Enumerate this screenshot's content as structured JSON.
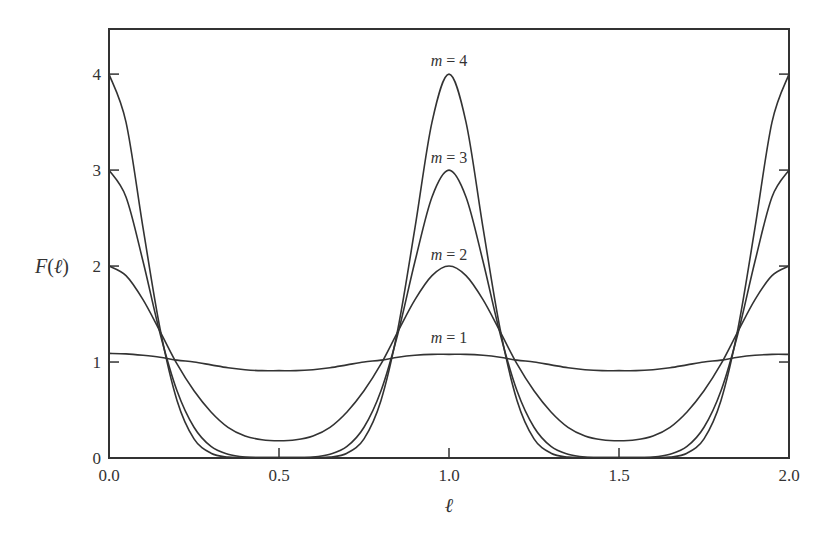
{
  "chart_data": {
    "type": "line",
    "title": "",
    "xlabel": "ℓ",
    "ylabel": "F(ℓ)",
    "xlim": [
      0.0,
      2.0
    ],
    "ylim": [
      0,
      4.5
    ],
    "grid": false,
    "legend": "inline curve labels",
    "x_ticks": [
      "0.0",
      "0.5",
      "1.0",
      "1.5",
      "2.0"
    ],
    "y_ticks": [
      "0",
      "1",
      "2",
      "3",
      "4"
    ],
    "annotations": [
      "m = 4",
      "m = 3",
      "m = 2",
      "m = 1"
    ],
    "x": [
      0.0,
      0.05,
      0.1,
      0.15,
      0.2,
      0.25,
      0.3,
      0.35,
      0.4,
      0.45,
      0.5,
      0.55,
      0.6,
      0.65,
      0.7,
      0.75,
      0.8,
      0.85,
      0.9,
      0.95,
      1.0,
      1.05,
      1.1,
      1.15,
      1.2,
      1.25,
      1.3,
      1.35,
      1.4,
      1.45,
      1.5,
      1.55,
      1.6,
      1.65,
      1.7,
      1.75,
      1.8,
      1.85,
      1.9,
      1.95,
      2.0
    ],
    "series": [
      {
        "name": "m = 1",
        "values": [
          1.09,
          1.085,
          1.07,
          1.05,
          1.02,
          1.0,
          0.97,
          0.94,
          0.92,
          0.91,
          0.91,
          0.91,
          0.92,
          0.94,
          0.97,
          1.0,
          1.02,
          1.05,
          1.07,
          1.08,
          1.08,
          1.08,
          1.07,
          1.05,
          1.02,
          1.0,
          0.97,
          0.94,
          0.92,
          0.91,
          0.91,
          0.91,
          0.92,
          0.94,
          0.97,
          1.0,
          1.02,
          1.05,
          1.07,
          1.08,
          1.08
        ]
      },
      {
        "name": "m = 2",
        "values": [
          2.0,
          1.9,
          1.65,
          1.32,
          0.98,
          0.7,
          0.48,
          0.32,
          0.23,
          0.19,
          0.18,
          0.19,
          0.23,
          0.32,
          0.48,
          0.7,
          0.98,
          1.32,
          1.65,
          1.9,
          2.0,
          1.9,
          1.65,
          1.32,
          0.98,
          0.7,
          0.48,
          0.32,
          0.23,
          0.19,
          0.18,
          0.19,
          0.23,
          0.32,
          0.48,
          0.7,
          0.98,
          1.32,
          1.65,
          1.9,
          2.0
        ]
      },
      {
        "name": "m = 3",
        "values": [
          3.0,
          2.72,
          2.05,
          1.3,
          0.7,
          0.32,
          0.12,
          0.04,
          0.01,
          0.0,
          0.0,
          0.0,
          0.01,
          0.04,
          0.12,
          0.32,
          0.7,
          1.3,
          2.05,
          2.72,
          3.0,
          2.72,
          2.05,
          1.3,
          0.7,
          0.32,
          0.12,
          0.04,
          0.01,
          0.0,
          0.0,
          0.0,
          0.01,
          0.04,
          0.12,
          0.32,
          0.7,
          1.3,
          2.05,
          2.72,
          3.0
        ]
      },
      {
        "name": "m = 4",
        "values": [
          4.0,
          3.5,
          2.4,
          1.35,
          0.6,
          0.2,
          0.05,
          0.01,
          0.0,
          0.0,
          0.0,
          0.0,
          0.0,
          0.01,
          0.05,
          0.2,
          0.6,
          1.35,
          2.4,
          3.5,
          4.0,
          3.5,
          2.4,
          1.35,
          0.6,
          0.2,
          0.05,
          0.01,
          0.0,
          0.0,
          0.0,
          0.0,
          0.0,
          0.01,
          0.05,
          0.2,
          0.6,
          1.35,
          2.4,
          3.5,
          4.0
        ]
      }
    ]
  },
  "labels": {
    "ylabel": "F(ℓ)",
    "xlabel": "ℓ",
    "curve_labels": [
      "m = 4",
      "m = 3",
      "m = 2",
      "m = 1"
    ]
  }
}
